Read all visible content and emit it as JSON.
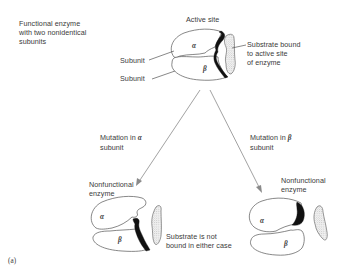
{
  "top": {
    "title_lines": [
      "Functional enzyme",
      "with two nonidentical",
      "subunits"
    ],
    "active_site_label": "Active site",
    "subunit_labels": [
      "Subunit",
      "Subunit"
    ],
    "subunit_symbols": [
      "α",
      "β"
    ],
    "substrate_label_lines": [
      "Substrate bound",
      "to active site",
      "of enzyme"
    ]
  },
  "left_branch": {
    "mutation_label_line1_prefix": "Mutation in ",
    "mutation_symbol": "α",
    "mutation_label_line2": "subunit",
    "result_lines": [
      "Nonfunctional",
      "enzyme"
    ],
    "subunit_symbols": [
      "α",
      "β"
    ]
  },
  "right_branch": {
    "mutation_label_line1_prefix": "Mutation in ",
    "mutation_symbol": "β",
    "mutation_label_line2": "subunit",
    "result_lines": [
      "Nonfunctional",
      "enzyme"
    ],
    "subunit_symbols": [
      "α",
      "β"
    ]
  },
  "bottom_note_lines": [
    "Substrate is not",
    "bound in either case"
  ],
  "panel_label": "(a)",
  "colors": {
    "outline": "#555555",
    "active_site": "#111111",
    "arrow": "#8a8a8a",
    "text": "#3a3a3a"
  }
}
